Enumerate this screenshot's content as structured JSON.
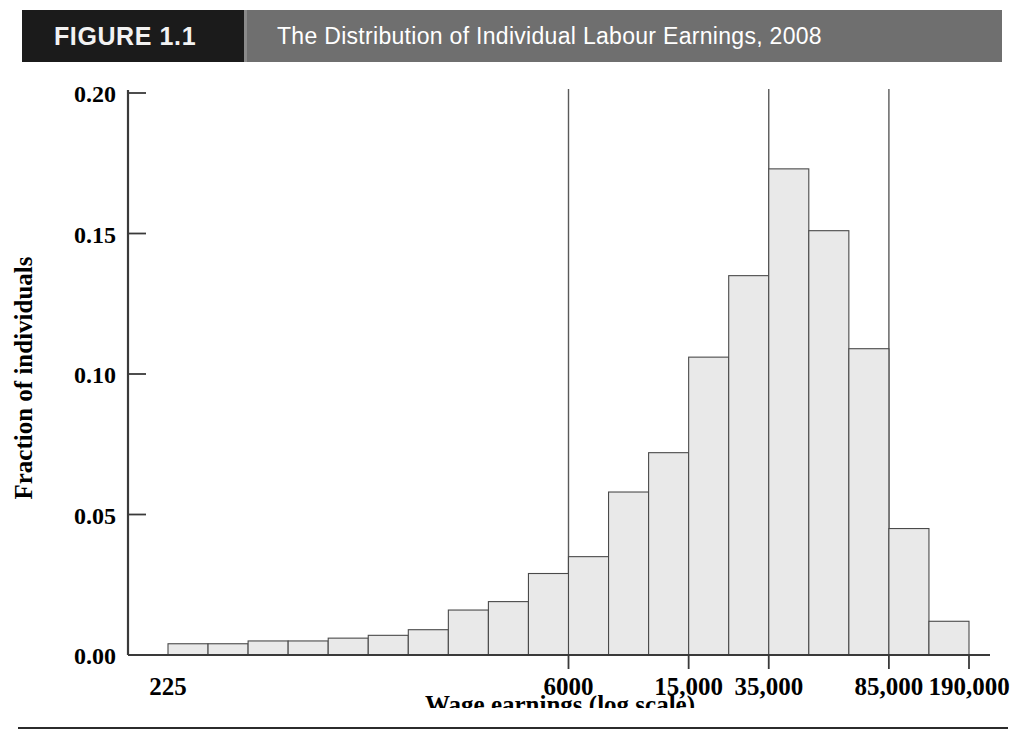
{
  "header": {
    "figure_number": "FIGURE 1.1",
    "title": "The Distribution of Individual Labour Earnings, 2008",
    "number_box_color": "#1b1b1b",
    "title_box_color": "#6f6f6f",
    "title_text_color": "#ffffff"
  },
  "chart_data": {
    "type": "bar",
    "title": "The Distribution of Individual Labour Earnings, 2008",
    "subtitle": "",
    "xlabel": "Wage earnings (log scale)",
    "ylabel": "Fraction of individuals",
    "grid": false,
    "legend": false,
    "legend_position": "none",
    "bar_fill_color": "#e9e9e9",
    "bar_stroke_color": "#4a4a4a",
    "axis_color": "#3a3a3a",
    "ylim": [
      0.0,
      0.2
    ],
    "ytick_values": [
      0.0,
      0.05,
      0.1,
      0.15,
      0.2
    ],
    "ytick_labels": [
      "0.00",
      "0.05",
      "0.10",
      "0.15",
      "0.20"
    ],
    "xtick_labels": [
      "225",
      "6000",
      "15,000",
      "35,000",
      "85,000",
      "190,000"
    ],
    "xtick_bar_index": [
      0,
      10,
      13,
      15,
      18,
      20
    ],
    "reference_lines": [
      {
        "label": "6000",
        "bar_index": 10
      },
      {
        "label": "35,000",
        "bar_index": 15
      },
      {
        "label": "85,000",
        "bar_index": 18
      }
    ],
    "categories": [
      "bin-1",
      "bin-2",
      "bin-3",
      "bin-4",
      "bin-5",
      "bin-6",
      "bin-7",
      "bin-8",
      "bin-9",
      "bin-10",
      "bin-11",
      "bin-12",
      "bin-13",
      "bin-14",
      "bin-15",
      "bin-16",
      "bin-17",
      "bin-18",
      "bin-19",
      "bin-20"
    ],
    "values": [
      0.004,
      0.004,
      0.005,
      0.005,
      0.006,
      0.007,
      0.009,
      0.016,
      0.019,
      0.029,
      0.035,
      0.058,
      0.072,
      0.106,
      0.135,
      0.173,
      0.151,
      0.109,
      0.045,
      0.012
    ]
  },
  "axis": {
    "y_title": "Fraction of individuals",
    "x_title": "Wage earnings (log scale)"
  }
}
